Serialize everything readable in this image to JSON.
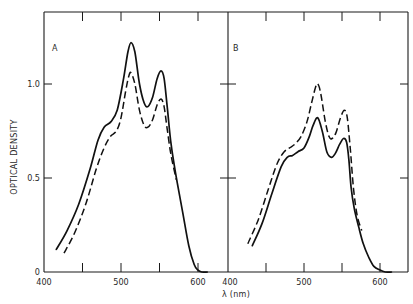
{
  "figure": {
    "y_axis_title": "OPTICAL DENSITY",
    "x_axis_title": "λ (nm)",
    "y_tick_labels": [
      "0",
      "0.5",
      "1.0"
    ],
    "x_tick_labels_panel_a": [
      "400",
      "500",
      "600"
    ],
    "x_tick_labels_panel_b": [
      "400",
      "500",
      "600"
    ],
    "panel_a_label": "A",
    "panel_b_label": "B"
  },
  "chart_data": [
    {
      "type": "line",
      "panel": "A",
      "title": "",
      "xlabel": "λ (nm)",
      "ylabel": "OPTICAL DENSITY",
      "xlim": [
        400,
        625
      ],
      "ylim": [
        0,
        1.3
      ],
      "x_ticks": [
        400,
        450,
        500,
        550,
        600
      ],
      "x_tick_labels": [
        "400",
        "500",
        "600"
      ],
      "y_ticks": [
        0,
        0.5,
        1.0
      ],
      "y_tick_labels": [
        "0",
        "0.5",
        "1.0"
      ],
      "grid": false,
      "legend": null,
      "series": [
        {
          "name": "solid",
          "style": "solid",
          "x": [
            416,
            430,
            445,
            460,
            470,
            478,
            487,
            495,
            503,
            509,
            513,
            518,
            524,
            530,
            535,
            541,
            547,
            552,
            556,
            560,
            565,
            572,
            580,
            588,
            595,
            600,
            605,
            612
          ],
          "y": [
            0.12,
            0.22,
            0.36,
            0.55,
            0.7,
            0.77,
            0.8,
            0.86,
            1.02,
            1.17,
            1.22,
            1.17,
            1.0,
            0.9,
            0.88,
            0.93,
            1.03,
            1.07,
            1.03,
            0.88,
            0.68,
            0.5,
            0.32,
            0.14,
            0.04,
            0.01,
            0.0,
            0.0
          ]
        },
        {
          "name": "dashed",
          "style": "dashed",
          "x": [
            426,
            440,
            455,
            468,
            478,
            486,
            494,
            500,
            506,
            510,
            513,
            518,
            524,
            530,
            535,
            541,
            547,
            552,
            556,
            560,
            565,
            572
          ],
          "y": [
            0.1,
            0.21,
            0.37,
            0.55,
            0.66,
            0.72,
            0.75,
            0.82,
            0.96,
            1.04,
            1.06,
            1.0,
            0.86,
            0.78,
            0.77,
            0.81,
            0.89,
            0.92,
            0.88,
            0.76,
            0.62,
            0.49
          ]
        }
      ]
    },
    {
      "type": "line",
      "panel": "B",
      "title": "",
      "xlabel": "λ (nm)",
      "ylabel": "OPTICAL DENSITY",
      "xlim": [
        400,
        625
      ],
      "ylim": [
        0,
        1.3
      ],
      "x_ticks": [
        400,
        450,
        500,
        550,
        600
      ],
      "x_tick_labels": [
        "400",
        "500",
        "600"
      ],
      "y_ticks": [
        0,
        0.5,
        1.0
      ],
      "grid": false,
      "legend": null,
      "series": [
        {
          "name": "solid",
          "style": "solid",
          "x": [
            432,
            445,
            458,
            470,
            478,
            485,
            492,
            500,
            507,
            512,
            518,
            524,
            530,
            536,
            541,
            547,
            552,
            556,
            559,
            562,
            566,
            572,
            578,
            585,
            592,
            600,
            607,
            615
          ],
          "y": [
            0.14,
            0.26,
            0.42,
            0.56,
            0.61,
            0.62,
            0.64,
            0.66,
            0.72,
            0.78,
            0.82,
            0.75,
            0.64,
            0.61,
            0.63,
            0.68,
            0.71,
            0.69,
            0.6,
            0.45,
            0.34,
            0.24,
            0.15,
            0.08,
            0.03,
            0.01,
            0.0,
            0.0
          ]
        },
        {
          "name": "dashed",
          "style": "dashed",
          "x": [
            426,
            440,
            453,
            465,
            474,
            481,
            488,
            496,
            504,
            510,
            515,
            518,
            522,
            528,
            533,
            537,
            542,
            548,
            553,
            557,
            561,
            565,
            570,
            576
          ],
          "y": [
            0.15,
            0.28,
            0.44,
            0.58,
            0.64,
            0.66,
            0.68,
            0.72,
            0.8,
            0.9,
            0.98,
            1.0,
            0.95,
            0.8,
            0.72,
            0.71,
            0.74,
            0.82,
            0.86,
            0.82,
            0.65,
            0.45,
            0.3,
            0.22
          ]
        }
      ]
    }
  ]
}
